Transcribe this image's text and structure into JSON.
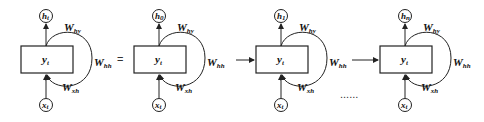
{
  "diagram": {
    "equals_sign": "=",
    "ellipsis": "......",
    "cells": [
      {
        "output": "h",
        "output_sub": "t",
        "hidden": "y",
        "hidden_sub": "t",
        "input": "x",
        "input_sub": "t",
        "w_hy": "W",
        "w_hy_sub": "hy",
        "w_hh": "W",
        "w_hh_sub": "hh",
        "w_xh": "W",
        "w_xh_sub": "xh"
      },
      {
        "output": "h",
        "output_sub": "0",
        "hidden": "y",
        "hidden_sub": "t",
        "input": "x",
        "input_sub": "t",
        "w_hy": "W",
        "w_hy_sub": "hy",
        "w_hh": "W",
        "w_hh_sub": "hh",
        "w_xh": "W",
        "w_xh_sub": "xh"
      },
      {
        "output": "h",
        "output_sub": "1",
        "hidden": "y",
        "hidden_sub": "t",
        "input": "x",
        "input_sub": "t",
        "w_hy": "W",
        "w_hy_sub": "hy",
        "w_hh": "W",
        "w_hh_sub": "hh",
        "w_xh": "W",
        "w_xh_sub": "xh"
      },
      {
        "output": "h",
        "output_sub": "n",
        "hidden": "y",
        "hidden_sub": "t",
        "input": "x",
        "input_sub": "t",
        "w_hy": "W",
        "w_hy_sub": "hy",
        "w_hh": "W",
        "w_hh_sub": "hh",
        "w_xh": "W",
        "w_xh_sub": "xh"
      }
    ]
  }
}
